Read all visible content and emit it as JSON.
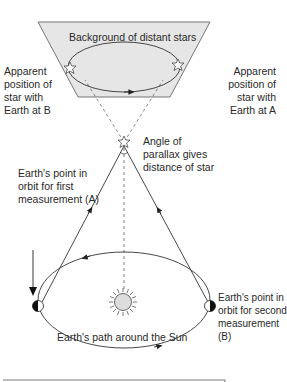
{
  "diagram": {
    "background_label": "Background of distant stars",
    "apparent_b_label": "Apparent\nposition of\nstar with\nEarth at B",
    "apparent_a_label": "Apparent\nposition of\nstar with\nEarth at A",
    "parallax_label": "Angle of\nparallax gives\ndistance of star",
    "point_a_label": "Earth's point in\norbit for first\nmeasurement (A)",
    "point_b_label": "Earth's point in\norbit for second\nmeasurement (B)",
    "orbit_label": "Earth's path around the Sun",
    "colors": {
      "panel_fill": "#e6e6e6",
      "line": "#333333",
      "sun_fill": "#dddddd"
    }
  }
}
